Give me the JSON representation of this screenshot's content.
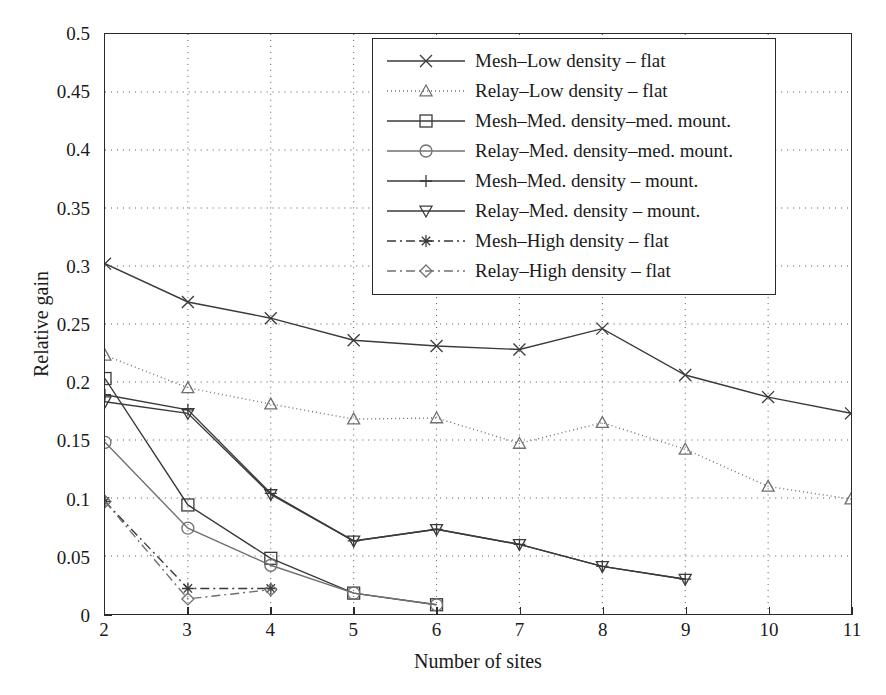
{
  "chart_data": {
    "type": "line",
    "title": "",
    "xlabel": "Number of sites",
    "ylabel": "Relative gain",
    "xlim": [
      2,
      11
    ],
    "ylim": [
      0,
      0.5
    ],
    "xticks": [
      "2",
      "3",
      "4",
      "5",
      "6",
      "7",
      "8",
      "9",
      "10",
      "11"
    ],
    "yticks": [
      "0",
      "0.05",
      "0.1",
      "0.15",
      "0.2",
      "0.25",
      "0.3",
      "0.35",
      "0.4",
      "0.45",
      "0.5"
    ],
    "ytick_values": [
      0,
      0.05,
      0.1,
      0.15,
      0.2,
      0.25,
      0.3,
      0.35,
      0.4,
      0.45,
      0.5
    ],
    "grid": "dotted",
    "legend_position": "top-right-inside",
    "series": [
      {
        "name": "Mesh–Low density – flat",
        "marker": "x",
        "linestyle": "solid",
        "color": "#3a3a3a",
        "x": [
          2,
          3,
          4,
          5,
          6,
          7,
          8,
          9,
          10,
          11
        ],
        "values": [
          0.302,
          0.269,
          0.255,
          0.236,
          0.231,
          0.228,
          0.246,
          0.206,
          0.187,
          0.173
        ]
      },
      {
        "name": "Relay–Low density – flat",
        "marker": "triangle-up",
        "linestyle": "dotted",
        "color": "#707070",
        "x": [
          2,
          3,
          4,
          5,
          6,
          7,
          8,
          9,
          10,
          11
        ],
        "values": [
          0.223,
          0.195,
          0.181,
          0.168,
          0.169,
          0.147,
          0.165,
          0.142,
          0.11,
          0.099
        ]
      },
      {
        "name": "Mesh–Med. density–med. mount.",
        "marker": "square",
        "linestyle": "solid",
        "color": "#3a3a3a",
        "x": [
          2,
          3,
          4,
          5,
          6
        ],
        "values": [
          0.203,
          0.094,
          0.048,
          0.018,
          0.008
        ]
      },
      {
        "name": "Relay–Med. density–med. mount.",
        "marker": "circle",
        "linestyle": "solid",
        "color": "#707070",
        "x": [
          2,
          3,
          4,
          5,
          6
        ],
        "values": [
          0.148,
          0.074,
          0.042,
          0.018,
          0.008
        ]
      },
      {
        "name": "Mesh–Med. density – mount.",
        "marker": "plus",
        "linestyle": "solid",
        "color": "#3a3a3a",
        "x": [
          2,
          3,
          4,
          5,
          6,
          7,
          8,
          9
        ],
        "values": [
          0.189,
          0.176,
          0.104,
          0.063,
          0.073,
          0.06,
          0.041,
          0.03
        ]
      },
      {
        "name": "Relay–Med. density – mount.",
        "marker": "triangle-down",
        "linestyle": "solid",
        "color": "#3a3a3a",
        "x": [
          2,
          3,
          4,
          5,
          6,
          7,
          8,
          9
        ],
        "values": [
          0.183,
          0.173,
          0.103,
          0.063,
          0.073,
          0.06,
          0.041,
          0.03
        ]
      },
      {
        "name": "Mesh–High density – flat",
        "marker": "asterisk",
        "linestyle": "dashdot",
        "color": "#3a3a3a",
        "x": [
          2,
          3,
          4
        ],
        "values": [
          0.097,
          0.022,
          0.022
        ]
      },
      {
        "name": "Relay–High density – flat",
        "marker": "diamond",
        "linestyle": "dashdot",
        "color": "#707070",
        "x": [
          2,
          3,
          4
        ],
        "values": [
          0.097,
          0.013,
          0.021
        ]
      }
    ]
  },
  "legend": {
    "entries": [
      "Mesh–Low density – flat",
      "Relay–Low density – flat",
      "Mesh–Med. density–med. mount.",
      "Relay–Med. density–med. mount.",
      "Mesh–Med. density – mount.",
      "Relay–Med. density – mount.",
      "Mesh–High density – flat",
      "Relay–High density – flat"
    ]
  }
}
